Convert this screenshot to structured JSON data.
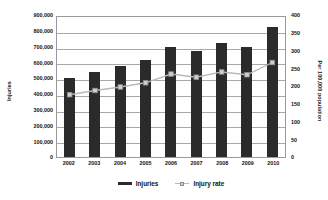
{
  "chart_data": {
    "type": "bar",
    "title": "",
    "subtitle": "",
    "xlabel": "",
    "ylabel": "Injuries",
    "y2label": "Per 100,000 population",
    "categories": [
      "2002",
      "2003",
      "2004",
      "2005",
      "2006",
      "2007",
      "2008",
      "2009",
      "2010"
    ],
    "series": [
      {
        "name": "Injuries",
        "type": "bar",
        "axis": "left",
        "color": "#2b2b2b",
        "values": [
          503000,
          540000,
          575000,
          617000,
          700000,
          675000,
          725000,
          700000,
          825000
        ]
      },
      {
        "name": "Injury rate",
        "type": "line",
        "axis": "right",
        "color": "#b9b9b9",
        "marker_color": "#cfcfcf",
        "values": [
          178,
          190,
          200,
          212,
          237,
          228,
          243,
          235,
          270
        ]
      }
    ],
    "ylim": [
      0,
      900000
    ],
    "y2lim": [
      0,
      400
    ],
    "yticks": [
      "0",
      "100,000",
      "200,000",
      "300,000",
      "400,000",
      "500,000",
      "600,000",
      "700,000",
      "800,000",
      "900,000"
    ],
    "ytick_values": [
      0,
      100000,
      200000,
      300000,
      400000,
      500000,
      600000,
      700000,
      800000,
      900000
    ],
    "y2ticks": [
      "0",
      "50",
      "100",
      "150",
      "200",
      "250",
      "300",
      "350",
      "400"
    ],
    "y2tick_values": [
      0,
      50,
      100,
      150,
      200,
      250,
      300,
      350,
      400
    ],
    "grid": true,
    "grid_axis": "y",
    "legend_position": "bottom",
    "legend": [
      "Injuries",
      "Injury rate"
    ]
  }
}
